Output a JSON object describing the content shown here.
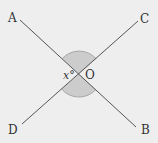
{
  "diagram": {
    "type": "intersecting-lines",
    "background": "#eeeeee",
    "line_color": "#555555",
    "arc_fill": "#cccccc",
    "arc_stroke": "#999999",
    "center": {
      "label": "O",
      "x": 79,
      "y": 74
    },
    "angle_label": "x°",
    "points": [
      {
        "label": "A",
        "line_end": [
          20,
          20
        ]
      },
      {
        "label": "B",
        "line_end": [
          136,
          127
        ]
      },
      {
        "label": "C",
        "line_end": [
          138,
          21
        ]
      },
      {
        "label": "D",
        "line_end": [
          22,
          124
        ]
      }
    ],
    "lines": [
      {
        "name": "AB",
        "from": "A",
        "to": "B"
      },
      {
        "name": "CD",
        "from": "C",
        "to": "D"
      }
    ],
    "shaded_angles": [
      {
        "between": [
          "A",
          "C"
        ],
        "position": "top"
      },
      {
        "between": [
          "D",
          "B"
        ],
        "position": "bottom"
      }
    ]
  }
}
